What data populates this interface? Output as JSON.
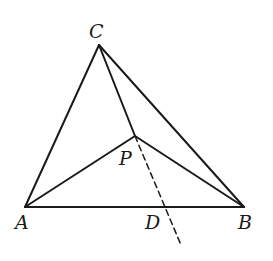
{
  "diagram": {
    "type": "geometry",
    "stroke_color": "#1a1a1a",
    "points": {
      "A": {
        "label": "A",
        "x": 25,
        "y": 207
      },
      "B": {
        "label": "B",
        "x": 244,
        "y": 207
      },
      "C": {
        "label": "C",
        "x": 99,
        "y": 45
      },
      "P": {
        "label": "P",
        "x": 135,
        "y": 136
      },
      "D": {
        "label": "D",
        "x": 166,
        "y": 207
      }
    },
    "segments": [
      {
        "from": "A",
        "to": "B",
        "style": "solid"
      },
      {
        "from": "A",
        "to": "C",
        "style": "solid"
      },
      {
        "from": "C",
        "to": "B",
        "style": "solid"
      },
      {
        "from": "C",
        "to": "P",
        "style": "solid"
      },
      {
        "from": "A",
        "to": "P",
        "style": "solid"
      },
      {
        "from": "P",
        "to": "B",
        "style": "solid"
      },
      {
        "from": "P",
        "to": "D",
        "style": "dashed",
        "extended": true
      }
    ],
    "labels": {
      "A": "A",
      "B": "B",
      "C": "C",
      "P": "P",
      "D": "D"
    }
  }
}
